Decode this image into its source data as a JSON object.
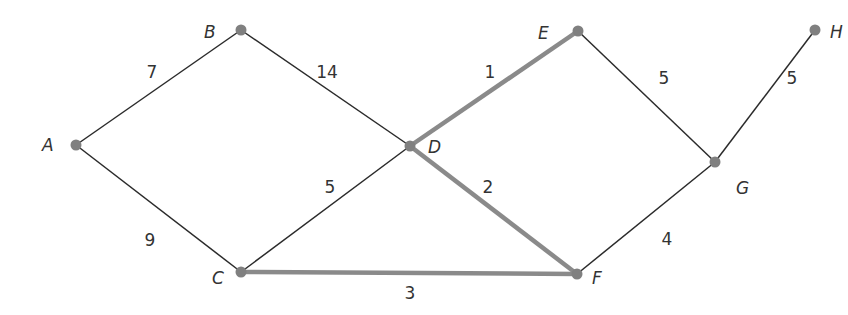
{
  "graph": {
    "nodes": [
      {
        "id": "A",
        "label": "A",
        "x": 76,
        "y": 145,
        "lx": 42,
        "ly": 151
      },
      {
        "id": "B",
        "label": "B",
        "x": 241,
        "y": 30,
        "lx": 204,
        "ly": 38
      },
      {
        "id": "C",
        "label": "C",
        "x": 241,
        "y": 272,
        "lx": 212,
        "ly": 284
      },
      {
        "id": "D",
        "label": "D",
        "x": 410,
        "y": 146,
        "lx": 428,
        "ly": 153
      },
      {
        "id": "E",
        "label": "E",
        "x": 578,
        "y": 31,
        "lx": 538,
        "ly": 39
      },
      {
        "id": "F",
        "label": "F",
        "x": 577,
        "y": 274,
        "lx": 592,
        "ly": 284
      },
      {
        "id": "G",
        "label": "G",
        "x": 715,
        "y": 162,
        "lx": 736,
        "ly": 194
      },
      {
        "id": "H",
        "label": "H",
        "x": 815,
        "y": 30,
        "lx": 830,
        "ly": 38
      }
    ],
    "edges": [
      {
        "from": "A",
        "to": "B",
        "weight": "7",
        "highlighted": false,
        "wx": 152,
        "wy": 78
      },
      {
        "from": "B",
        "to": "D",
        "weight": "14",
        "highlighted": false,
        "wx": 327,
        "wy": 78
      },
      {
        "from": "A",
        "to": "C",
        "weight": "9",
        "highlighted": false,
        "wx": 150,
        "wy": 246
      },
      {
        "from": "C",
        "to": "D",
        "weight": "5",
        "highlighted": false,
        "wx": 330,
        "wy": 193
      },
      {
        "from": "D",
        "to": "E",
        "weight": "1",
        "highlighted": true,
        "wx": 490,
        "wy": 78
      },
      {
        "from": "D",
        "to": "F",
        "weight": "2",
        "highlighted": true,
        "wx": 488,
        "wy": 193
      },
      {
        "from": "C",
        "to": "F",
        "weight": "3",
        "highlighted": true,
        "wx": 410,
        "wy": 299
      },
      {
        "from": "E",
        "to": "G",
        "weight": "5",
        "highlighted": false,
        "wx": 664,
        "wy": 84
      },
      {
        "from": "G",
        "to": "H",
        "weight": "5",
        "highlighted": false,
        "wx": 792,
        "wy": 84
      },
      {
        "from": "F",
        "to": "G",
        "weight": "4",
        "highlighted": false,
        "wx": 667,
        "wy": 245
      }
    ],
    "colors": {
      "edge": "#2b2b2b",
      "highlighted_edge": "#8a8a8a",
      "node": "#808080",
      "label": "#333333"
    }
  }
}
